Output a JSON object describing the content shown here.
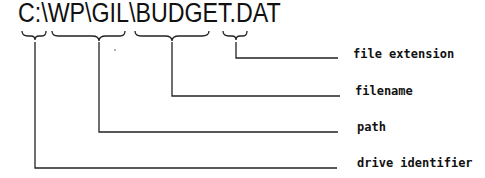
{
  "diagram": {
    "filepath": "C:\\WP\\GIL\\BUDGET.DAT",
    "parts": [
      {
        "id": "drive",
        "text": "C:",
        "label": "drive identifier"
      },
      {
        "id": "path",
        "text": "\\WP\\GIL",
        "label": "path"
      },
      {
        "id": "filename",
        "text": "\\BUDGET",
        "label": "filename"
      },
      {
        "id": "extension",
        "text": ".DAT",
        "label": "file extension"
      }
    ],
    "labels": {
      "extension": "file extension",
      "filename": "filename",
      "path": "path",
      "drive": "drive identifier"
    }
  }
}
